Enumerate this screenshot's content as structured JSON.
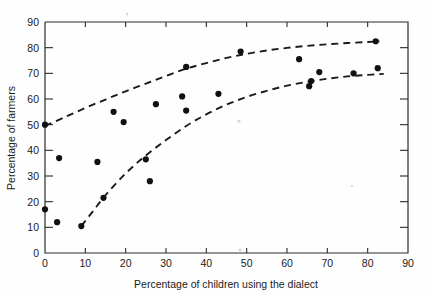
{
  "chart_data": {
    "type": "scatter",
    "title": "",
    "xlabel": "Percentage of children using the dialect",
    "ylabel": "Percentage of farmers",
    "xlim": [
      0,
      90
    ],
    "ylim": [
      0,
      90
    ],
    "xticks": [
      0,
      10,
      20,
      30,
      40,
      50,
      60,
      70,
      80,
      90
    ],
    "yticks": [
      0,
      10,
      20,
      30,
      40,
      50,
      60,
      70,
      80,
      90
    ],
    "grid": false,
    "legend": "none",
    "marker": "filled-circle",
    "marker_color": "#111111",
    "points": [
      {
        "x": 0.0,
        "y": 17.0
      },
      {
        "x": 0.0,
        "y": 50.0
      },
      {
        "x": 3.0,
        "y": 12.0
      },
      {
        "x": 3.5,
        "y": 37.0
      },
      {
        "x": 9.0,
        "y": 10.5
      },
      {
        "x": 13.0,
        "y": 35.5
      },
      {
        "x": 14.5,
        "y": 21.5
      },
      {
        "x": 17.0,
        "y": 55.0
      },
      {
        "x": 19.5,
        "y": 51.0
      },
      {
        "x": 25.0,
        "y": 36.5
      },
      {
        "x": 26.0,
        "y": 28.0
      },
      {
        "x": 27.5,
        "y": 58.0
      },
      {
        "x": 34.0,
        "y": 61.0
      },
      {
        "x": 35.0,
        "y": 72.5
      },
      {
        "x": 35.0,
        "y": 55.5
      },
      {
        "x": 43.0,
        "y": 62.0
      },
      {
        "x": 48.5,
        "y": 78.5
      },
      {
        "x": 63.0,
        "y": 75.5
      },
      {
        "x": 65.5,
        "y": 65.0
      },
      {
        "x": 66.0,
        "y": 67.0
      },
      {
        "x": 68.0,
        "y": 70.5
      },
      {
        "x": 76.5,
        "y": 70.0
      },
      {
        "x": 82.0,
        "y": 82.5
      },
      {
        "x": 82.5,
        "y": 72.0
      }
    ],
    "curves": [
      {
        "name": "upper-envelope",
        "style": "dashed",
        "color": "#1a1a1a",
        "points": [
          {
            "x": 0.0,
            "y": 49.5
          },
          {
            "x": 5.0,
            "y": 53.0
          },
          {
            "x": 10.0,
            "y": 56.5
          },
          {
            "x": 15.0,
            "y": 59.8
          },
          {
            "x": 20.0,
            "y": 63.0
          },
          {
            "x": 25.0,
            "y": 66.0
          },
          {
            "x": 30.0,
            "y": 69.0
          },
          {
            "x": 35.0,
            "y": 71.8
          },
          {
            "x": 40.0,
            "y": 74.0
          },
          {
            "x": 45.0,
            "y": 76.0
          },
          {
            "x": 50.0,
            "y": 77.6
          },
          {
            "x": 55.0,
            "y": 78.9
          },
          {
            "x": 60.0,
            "y": 79.9
          },
          {
            "x": 65.0,
            "y": 80.7
          },
          {
            "x": 70.0,
            "y": 81.3
          },
          {
            "x": 75.0,
            "y": 81.8
          },
          {
            "x": 80.0,
            "y": 82.2
          },
          {
            "x": 83.0,
            "y": 82.5
          }
        ]
      },
      {
        "name": "lower-envelope",
        "style": "dashed",
        "color": "#1a1a1a",
        "points": [
          {
            "x": 9.0,
            "y": 10.5
          },
          {
            "x": 12.0,
            "y": 16.5
          },
          {
            "x": 15.0,
            "y": 22.5
          },
          {
            "x": 20.0,
            "y": 31.0
          },
          {
            "x": 25.0,
            "y": 38.0
          },
          {
            "x": 30.0,
            "y": 44.0
          },
          {
            "x": 35.0,
            "y": 49.5
          },
          {
            "x": 40.0,
            "y": 54.0
          },
          {
            "x": 45.0,
            "y": 57.8
          },
          {
            "x": 50.0,
            "y": 60.8
          },
          {
            "x": 55.0,
            "y": 63.2
          },
          {
            "x": 60.0,
            "y": 65.2
          },
          {
            "x": 65.0,
            "y": 66.7
          },
          {
            "x": 70.0,
            "y": 67.9
          },
          {
            "x": 75.0,
            "y": 68.8
          },
          {
            "x": 80.0,
            "y": 69.4
          },
          {
            "x": 84.0,
            "y": 69.8
          }
        ]
      }
    ]
  },
  "axes": {
    "x_title": "Percentage of children using the dialect",
    "y_title": "Percentage of farmers",
    "x_tick_labels": [
      "0",
      "10",
      "20",
      "30",
      "40",
      "50",
      "60",
      "70",
      "80",
      "90"
    ],
    "y_tick_labels": [
      "0",
      "10",
      "20",
      "30",
      "40",
      "50",
      "60",
      "70",
      "80",
      "90"
    ]
  }
}
